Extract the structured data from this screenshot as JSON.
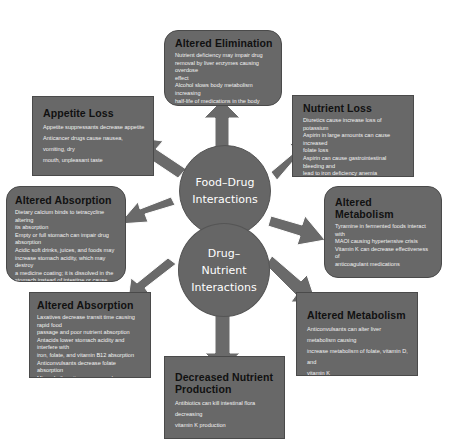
{
  "diagram": {
    "center": {
      "top_circle": {
        "lines": [
          "Food–Drug",
          "Interactions"
        ]
      },
      "bottom_circle": {
        "lines": [
          "Drug–",
          "Nutrient",
          "Interactions"
        ]
      }
    },
    "boxes": {
      "altered_elimination": {
        "title": "Altered Elimination",
        "lines": [
          "Nutrient deficiency may impair drug",
          "removal by liver enzymes causing overdose",
          "effect",
          "Alcohol slows body metabolism increasing",
          "half-life of medications in the body"
        ]
      },
      "appetite_loss": {
        "title": "Appetite Loss",
        "lines": [
          "Appetite suppressants decrease appetite",
          "Anticancer drugs cause nausea, vomiting, dry",
          "mouth, unpleasant taste"
        ]
      },
      "nutrient_loss": {
        "title": "Nutrient Loss",
        "lines": [
          "Diuretics cause increase loss of potassium",
          "Aspirin in large amounts can cause increased",
          "folate loss",
          "Aspirin can cause gastrointestinal bleeding and",
          "lead to iron deficiency anemia",
          "Anticonvulsants alter liver enzymes and cause",
          "increase removal of vitamin D"
        ]
      },
      "altered_absorption_food": {
        "title": "Altered Absorption",
        "lines": [
          "Dietary calcium binds to tetracycline altering",
          "its absorption",
          "Empty or full stomach can impair drug",
          "absorption",
          "Acidic soft drinks, juices, and foods may",
          "increase stomach acidity, which may destroy",
          "a medicine coating; it is dissolved in the",
          "stomach instead of intestine or cause",
          "release of timed medicines all at once"
        ]
      },
      "altered_metabolism_food": {
        "title": "Altered Metabolism",
        "lines": [
          "Tyramine in fermented foods interact with",
          "MAOI causing hypertensive crisis",
          "Vitamin K can decrease effectiveness of",
          "anticoagulant medications"
        ]
      },
      "altered_absorption_drug": {
        "title": "Altered Absorption",
        "lines": [
          "Laxatives decrease transit time causing rapid food",
          "passage and poor nutrient absorption",
          "Antacids lower stomach acidity and interfere with",
          "iron, folate, and vitamin B12 absorption",
          "Anticonvulsants decrease folate absorption",
          "Mineral oil coating mucosa reduces absorption of",
          "fat-soluble vitamins"
        ]
      },
      "altered_metabolism_drug": {
        "title": "Altered Metabolism",
        "lines": [
          "Anticonvulsants can alter liver metabolism causing",
          "increase metabolism of folate, vitamin D, and",
          "vitamin K"
        ]
      },
      "decreased_nutrient_production": {
        "title": "Decreased Nutrient Production",
        "lines": [
          "Antibiotics can kill intestinal flora decreasing",
          "vitamin K production"
        ]
      }
    },
    "colors": {
      "box_fill": "#686868",
      "circle_fill": "#666666",
      "arrow_fill": "#6a6a6a",
      "title_text": "#111111",
      "body_text": "#f2f2f2"
    }
  }
}
